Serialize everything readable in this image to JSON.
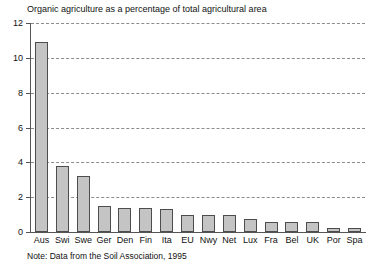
{
  "chart_data": {
    "type": "bar",
    "title": "Organic agriculture as a percentage of total agricultural area",
    "note": "Note: Data from the Soil Association, 1995",
    "xlabel": "",
    "ylabel": "",
    "ylim": [
      0,
      12
    ],
    "ytick_step": 2,
    "yticks": [
      0,
      2,
      4,
      6,
      8,
      10,
      12
    ],
    "ytick_labels": [
      "0",
      "2",
      "4",
      "6",
      "8",
      "10",
      "12"
    ],
    "grid": true,
    "grid_style": "dashed",
    "legend": false,
    "categories": [
      "Aus",
      "Swi",
      "Swe",
      "Ger",
      "Den",
      "Fin",
      "Ita",
      "EU",
      "Nwy",
      "Net",
      "Lux",
      "Fra",
      "Bel",
      "UK",
      "Por",
      "Spa"
    ],
    "values": [
      10.9,
      3.8,
      3.2,
      1.5,
      1.4,
      1.4,
      1.35,
      0.95,
      0.95,
      0.95,
      0.75,
      0.6,
      0.6,
      0.6,
      0.25,
      0.25
    ],
    "bar_fill_color": "#c4c4c4",
    "bar_edge_color": "#4d4d4d",
    "grid_color": "#8c8c8c",
    "axis_color": "#555555"
  }
}
